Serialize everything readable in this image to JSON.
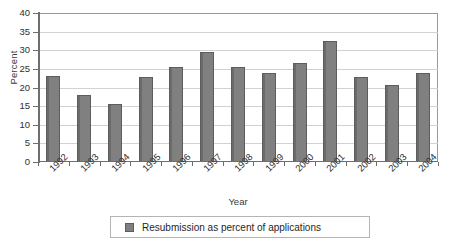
{
  "chart_data": {
    "type": "bar",
    "title": "",
    "xlabel": "Year",
    "ylabel": "Percent",
    "categories": [
      "1992",
      "1993",
      "1994",
      "1995",
      "1996",
      "1997",
      "1998",
      "1999",
      "2000",
      "2001",
      "2002",
      "2003",
      "2004"
    ],
    "values": [
      23.0,
      18.0,
      15.5,
      22.8,
      25.5,
      29.5,
      25.5,
      24.0,
      26.5,
      32.5,
      22.7,
      20.8,
      24.0
    ],
    "series": [
      {
        "name": "Resubmission as percent of applications",
        "values": [
          23.0,
          18.0,
          15.5,
          22.8,
          25.5,
          29.5,
          25.5,
          24.0,
          26.5,
          32.5,
          22.7,
          20.8,
          24.0
        ],
        "color": "#808080"
      }
    ],
    "ylim": [
      0,
      40
    ],
    "ytick_labels": [
      "0",
      "5",
      "10",
      "15",
      "20",
      "25",
      "30",
      "35",
      "40"
    ],
    "ytick_values": [
      0,
      5,
      10,
      15,
      20,
      25,
      30,
      35,
      40
    ],
    "grid": true,
    "legend_position": "bottom"
  },
  "legend": {
    "entries": [
      {
        "label": "Resubmission as percent of applications",
        "color": "#808080"
      }
    ]
  },
  "colors": {
    "bar_fill": "#808080",
    "bar_edge": "#5d5d5d",
    "gridline": "#d2d2d2",
    "axis": "#6e6e6e",
    "plot_background": "#ffffff"
  }
}
